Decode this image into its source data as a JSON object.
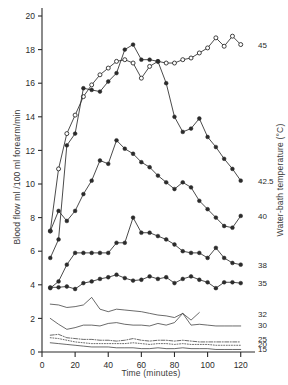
{
  "chart_data": {
    "type": "line",
    "title": "",
    "xlabel": "Time (minutes)",
    "ylabel": "Blood flow ml /100 ml forearm/min",
    "ylabel_right": "Water-bath temperature (°C)",
    "xlim": [
      0,
      125
    ],
    "ylim": [
      0,
      20
    ],
    "xticks": [
      0,
      20,
      40,
      60,
      80,
      100,
      120
    ],
    "xticklabels": [
      "0",
      "20",
      "40",
      "60",
      "80",
      "100",
      "120"
    ],
    "yticks": [
      0,
      2,
      4,
      6,
      8,
      10,
      12,
      14,
      16,
      18,
      20
    ],
    "yticklabels": [
      "0",
      "2",
      "4",
      "6",
      "8",
      "10",
      "12",
      "14",
      "16",
      "18",
      "20"
    ],
    "grid": false,
    "legend_position": "right-of-line-ends",
    "series": [
      {
        "name": "45",
        "label": "45",
        "marker": "open-circle",
        "linestyle": "solid",
        "label_y": 18.3,
        "x": [
          5,
          10,
          15,
          20,
          25,
          30,
          35,
          40,
          45,
          50,
          55,
          60,
          65,
          70,
          75,
          80,
          85,
          90,
          95,
          100,
          105,
          110,
          115,
          120
        ],
        "y": [
          7.2,
          10.9,
          13.0,
          14.1,
          15.2,
          15.9,
          16.5,
          16.9,
          17.3,
          17.4,
          17.2,
          16.3,
          17.0,
          17.3,
          17.2,
          17.2,
          17.4,
          17.5,
          17.8,
          18.1,
          18.7,
          18.2,
          18.8,
          18.3
        ]
      },
      {
        "name": "42.5",
        "label": "42.5",
        "marker": "filled-circle",
        "linestyle": "solid",
        "label_y": 10.2,
        "x": [
          5,
          10,
          15,
          20,
          25,
          30,
          35,
          40,
          45,
          50,
          55,
          60,
          65,
          70,
          75,
          80,
          85,
          90,
          95,
          100,
          105,
          110,
          115,
          120
        ],
        "y": [
          5.6,
          6.7,
          12.3,
          13.0,
          15.7,
          15.6,
          15.5,
          16.1,
          16.6,
          18.0,
          18.3,
          17.4,
          17.4,
          17.3,
          16.0,
          14.0,
          13.1,
          13.3,
          13.9,
          12.8,
          12.2,
          11.5,
          10.9,
          10.2
        ]
      },
      {
        "name": "40",
        "label": "40",
        "marker": "filled-circle",
        "linestyle": "solid",
        "label_y": 8.1,
        "x": [
          5,
          10,
          15,
          20,
          25,
          30,
          35,
          40,
          45,
          50,
          55,
          60,
          65,
          70,
          75,
          80,
          85,
          90,
          95,
          100,
          105,
          110,
          115,
          120
        ],
        "y": [
          7.2,
          8.4,
          7.8,
          8.4,
          9.4,
          10.2,
          11.4,
          11.2,
          12.6,
          12.1,
          11.8,
          11.3,
          11.0,
          10.5,
          10.1,
          9.7,
          10.1,
          9.8,
          9.0,
          8.5,
          8.0,
          7.5,
          7.4,
          8.1
        ]
      },
      {
        "name": "38",
        "label": "38",
        "marker": "filled-circle",
        "linestyle": "solid",
        "label_y": 5.2,
        "x": [
          5,
          10,
          15,
          20,
          25,
          30,
          35,
          40,
          45,
          50,
          55,
          60,
          65,
          70,
          75,
          80,
          85,
          90,
          95,
          100,
          105,
          110,
          115,
          120
        ],
        "y": [
          3.8,
          4.2,
          5.2,
          5.9,
          5.9,
          5.9,
          5.9,
          5.9,
          6.5,
          6.5,
          8.0,
          7.1,
          7.1,
          6.9,
          6.7,
          6.4,
          6.0,
          5.9,
          5.9,
          5.6,
          6.2,
          5.6,
          5.3,
          5.2
        ]
      },
      {
        "name": "35",
        "label": "35",
        "marker": "filled-circle",
        "linestyle": "solid",
        "label_y": 4.1,
        "x": [
          5,
          10,
          15,
          20,
          25,
          30,
          35,
          40,
          45,
          50,
          55,
          60,
          65,
          70,
          75,
          80,
          85,
          90,
          95,
          100,
          105,
          110,
          115,
          120
        ],
        "y": [
          3.85,
          3.85,
          3.9,
          3.75,
          4.1,
          4.2,
          4.35,
          4.45,
          4.6,
          4.4,
          4.25,
          4.3,
          4.5,
          4.35,
          4.45,
          4.1,
          4.35,
          4.5,
          4.3,
          4.15,
          3.8,
          4.15,
          4.15,
          4.1
        ]
      },
      {
        "name": "32",
        "label": "32",
        "marker": "none",
        "linestyle": "solid",
        "label_y": 2.25,
        "x": [
          5,
          10,
          15,
          20,
          25,
          30,
          35,
          40,
          45,
          50,
          55,
          60,
          65,
          70,
          75,
          80,
          85,
          90,
          95
        ],
        "y": [
          2.85,
          2.8,
          2.65,
          2.7,
          2.8,
          3.25,
          2.55,
          2.4,
          2.55,
          2.5,
          2.45,
          2.4,
          2.3,
          2.2,
          2.15,
          2.05,
          2.3,
          1.9,
          2.35
        ]
      },
      {
        "name": "30",
        "label": "30",
        "marker": "none",
        "linestyle": "solid",
        "label_y": 1.6,
        "x": [
          5,
          10,
          15,
          20,
          25,
          30,
          35,
          40,
          45,
          50,
          55,
          60,
          65,
          70,
          75,
          80,
          85,
          90,
          95,
          100,
          105,
          110,
          115,
          120
        ],
        "y": [
          2.0,
          1.65,
          1.35,
          1.45,
          1.6,
          1.6,
          1.55,
          1.7,
          1.75,
          1.65,
          1.6,
          1.6,
          1.55,
          1.7,
          1.6,
          1.75,
          2.3,
          1.6,
          1.65,
          1.6,
          1.55,
          1.55,
          1.55,
          1.55
        ]
      },
      {
        "name": "25",
        "label": "25",
        "marker": "none",
        "linestyle": "dashdot",
        "label_y": 0.75,
        "x": [
          5,
          10,
          15,
          20,
          25,
          30,
          35,
          40,
          45,
          50,
          55,
          60,
          65,
          70,
          75,
          80,
          85,
          90,
          95,
          100,
          105,
          110,
          115,
          120
        ],
        "y": [
          1.0,
          1.05,
          0.85,
          0.8,
          0.75,
          0.75,
          0.7,
          0.7,
          0.65,
          0.7,
          0.8,
          0.7,
          0.65,
          0.7,
          0.7,
          0.65,
          0.7,
          0.65,
          0.6,
          0.6,
          0.6,
          0.6,
          0.6,
          0.6
        ]
      },
      {
        "name": "20",
        "label": "20",
        "marker": "none",
        "linestyle": "dotted",
        "label_y": 0.45,
        "x": [
          5,
          10,
          15,
          20,
          25,
          30,
          35,
          40,
          45,
          50,
          55,
          60,
          65,
          70,
          75,
          80,
          85,
          90,
          95,
          100,
          105,
          110,
          115,
          120
        ],
        "y": [
          0.85,
          0.8,
          0.7,
          0.6,
          0.55,
          0.5,
          0.5,
          0.5,
          0.5,
          0.5,
          0.55,
          0.5,
          0.45,
          0.5,
          0.5,
          0.45,
          0.5,
          0.45,
          0.45,
          0.45,
          0.4,
          0.4,
          0.4,
          0.4
        ]
      },
      {
        "name": "15",
        "label": "15",
        "marker": "none",
        "linestyle": "solid",
        "label_y": 0.15,
        "x": [
          5,
          10,
          15,
          20,
          25,
          30,
          35,
          40,
          45,
          50,
          55,
          60,
          65,
          70,
          75,
          80,
          85,
          90,
          95,
          100,
          105,
          110,
          115,
          120
        ],
        "y": [
          0.55,
          0.5,
          0.45,
          0.4,
          0.35,
          0.3,
          0.3,
          0.3,
          0.25,
          0.25,
          0.25,
          0.2,
          0.2,
          0.25,
          0.2,
          0.2,
          0.25,
          0.2,
          0.2,
          0.2,
          0.15,
          0.15,
          0.15,
          0.15
        ]
      }
    ]
  },
  "colors": {
    "ink": "#2b2b2b",
    "background": "#ffffff"
  }
}
